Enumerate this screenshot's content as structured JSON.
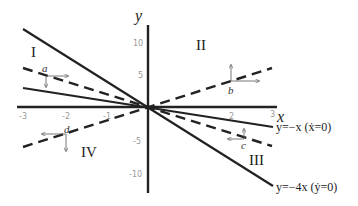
{
  "diagram": {
    "axes": {
      "x_label": "x",
      "y_label": "y",
      "x_ticks": [
        "-3",
        "-2",
        "-1",
        "2",
        "3"
      ],
      "y_ticks": [
        "10",
        "5",
        "-5",
        "-10"
      ]
    },
    "regions": {
      "I": "I",
      "II": "II",
      "III": "III",
      "IV": "IV"
    },
    "points": {
      "a": "a",
      "b": "b",
      "c": "c",
      "d": "d"
    },
    "nullclines": {
      "x_nullcline": "y=−x (ẋ=0)",
      "y_nullcline": "y=−4x (ẏ=0)"
    }
  }
}
